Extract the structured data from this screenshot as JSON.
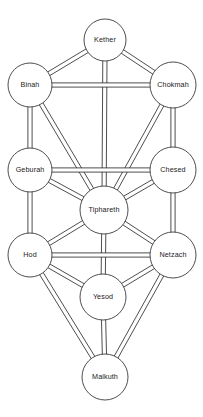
{
  "diagram": {
    "background_color": "#ffffff",
    "stroke_color": "#3a3a3a",
    "node_fill_color": "#ffffff",
    "label_color": "#1a1a1a",
    "nodes": [
      {
        "id": "kether",
        "label": "Kether",
        "cx": 105,
        "cy": 40,
        "r": 21
      },
      {
        "id": "binah",
        "label": "Binah",
        "cx": 30,
        "cy": 85,
        "r": 22
      },
      {
        "id": "chokmah",
        "label": "Chokmah",
        "cx": 173,
        "cy": 85,
        "r": 23
      },
      {
        "id": "geburah",
        "label": "Geburah",
        "cx": 30,
        "cy": 170,
        "r": 22
      },
      {
        "id": "chesed",
        "label": "Chesed",
        "cx": 173,
        "cy": 170,
        "r": 23
      },
      {
        "id": "tiphareth",
        "label": "Tiphareth",
        "cx": 104,
        "cy": 210,
        "r": 24
      },
      {
        "id": "hod",
        "label": "Hod",
        "cx": 30,
        "cy": 255,
        "r": 22
      },
      {
        "id": "netzach",
        "label": "Netzach",
        "cx": 173,
        "cy": 255,
        "r": 23
      },
      {
        "id": "yesod",
        "label": "Yesod",
        "cx": 103,
        "cy": 297,
        "r": 23
      },
      {
        "id": "malkuth",
        "label": "Malkuth",
        "cx": 105,
        "cy": 377,
        "r": 23
      }
    ],
    "paths": [
      {
        "from": "kether",
        "to": "binah"
      },
      {
        "from": "kether",
        "to": "chokmah"
      },
      {
        "from": "kether",
        "to": "tiphareth"
      },
      {
        "from": "binah",
        "to": "chokmah"
      },
      {
        "from": "binah",
        "to": "geburah"
      },
      {
        "from": "binah",
        "to": "tiphareth"
      },
      {
        "from": "chokmah",
        "to": "chesed"
      },
      {
        "from": "chokmah",
        "to": "tiphareth"
      },
      {
        "from": "geburah",
        "to": "chesed"
      },
      {
        "from": "geburah",
        "to": "tiphareth"
      },
      {
        "from": "geburah",
        "to": "hod"
      },
      {
        "from": "chesed",
        "to": "tiphareth"
      },
      {
        "from": "chesed",
        "to": "netzach"
      },
      {
        "from": "tiphareth",
        "to": "hod"
      },
      {
        "from": "tiphareth",
        "to": "netzach"
      },
      {
        "from": "tiphareth",
        "to": "yesod"
      },
      {
        "from": "hod",
        "to": "netzach"
      },
      {
        "from": "hod",
        "to": "yesod"
      },
      {
        "from": "hod",
        "to": "malkuth"
      },
      {
        "from": "netzach",
        "to": "yesod"
      },
      {
        "from": "netzach",
        "to": "malkuth"
      },
      {
        "from": "yesod",
        "to": "malkuth"
      }
    ],
    "path_width": 4.2
  }
}
